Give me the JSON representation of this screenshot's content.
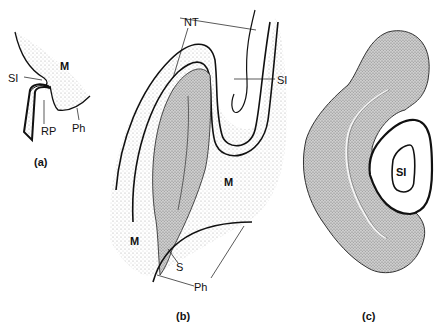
{
  "figure": {
    "panels": [
      {
        "id": "a",
        "caption": "(a)",
        "labels": {
          "m": "M",
          "si": "SI",
          "rp": "RP",
          "ph": "Ph"
        }
      },
      {
        "id": "b",
        "caption": "(b)",
        "labels": {
          "nt": "NT",
          "si": "SI",
          "m1": "M",
          "m2": "M",
          "s": "S",
          "ph": "Ph"
        }
      },
      {
        "id": "c",
        "caption": "(c)",
        "labels": {
          "si": "SI"
        }
      }
    ],
    "colors": {
      "ink": "#111111",
      "stipple_light": "#c8c8c8",
      "stipple_dense": "#9a9a9a",
      "background": "#ffffff"
    }
  }
}
